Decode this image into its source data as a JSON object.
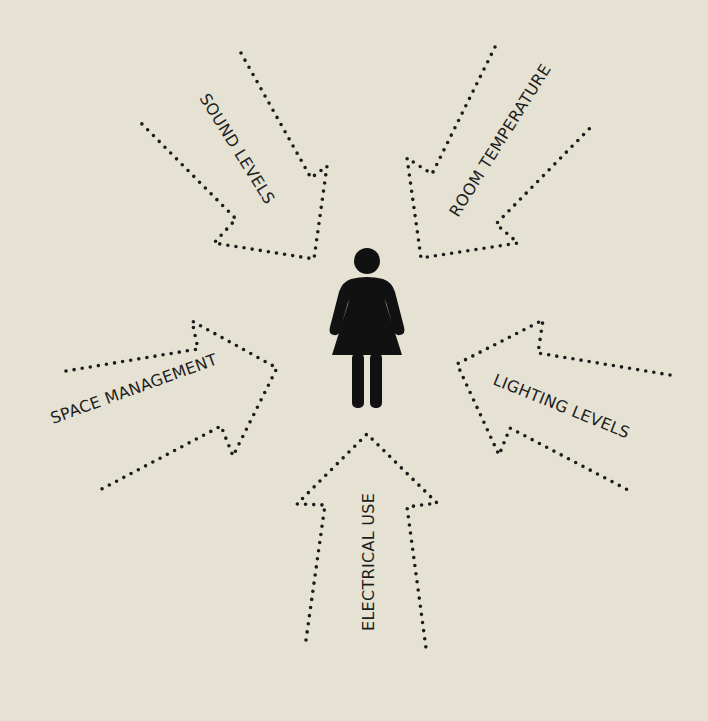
{
  "diagram": {
    "background_color": "#e5e2d3",
    "ink_color": "#1c1c1c",
    "center": {
      "icon": "person-female-icon"
    },
    "arrows": [
      {
        "id": "sound-levels",
        "label": "SOUND LEVELS",
        "direction": "toward-center"
      },
      {
        "id": "room-temperature",
        "label": "ROOM TEMPERATURE",
        "direction": "toward-center"
      },
      {
        "id": "space-management",
        "label": "SPACE MANAGEMENT",
        "direction": "toward-center"
      },
      {
        "id": "lighting-levels",
        "label": "LIGHTING LEVELS",
        "direction": "toward-center"
      },
      {
        "id": "electrical-use",
        "label": "ELECTRICAL USE",
        "direction": "toward-center"
      }
    ]
  }
}
